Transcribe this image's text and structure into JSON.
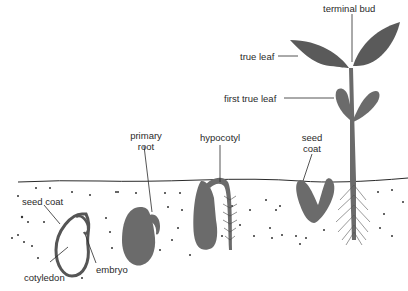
{
  "diagram": {
    "type": "seed germination stages (dicot bean)",
    "colors": {
      "background": "#ffffff",
      "ink": "#2a2a2a",
      "seed_fill": "#6b6b6b",
      "leaf_fill": "#5a5a5a",
      "stem_fill": "#707070",
      "soil_dot": "#333333"
    },
    "stages": [
      {
        "id": "stage-1-seed",
        "labels": [
          "seed coat",
          "cotyledon",
          "embryo"
        ]
      },
      {
        "id": "stage-2-primary-root",
        "labels": [
          "primary root"
        ]
      },
      {
        "id": "stage-3-hypocotyl",
        "labels": [
          "hypocotyl"
        ]
      },
      {
        "id": "stage-4-seed-coat",
        "labels": [
          "seed coat"
        ]
      },
      {
        "id": "stage-5-seedling",
        "labels": [
          "terminal bud",
          "true leaf",
          "first true leaf"
        ]
      }
    ],
    "labels": {
      "seed_coat_1": "seed coat",
      "cotyledon": "cotyledon",
      "embryo": "embryo",
      "primary_root_line1": "primary",
      "primary_root_line2": "root",
      "hypocotyl": "hypocotyl",
      "seed_coat_2_line1": "seed",
      "seed_coat_2_line2": "coat",
      "terminal_bud": "terminal bud",
      "true_leaf": "true leaf",
      "first_true_leaf": "first true leaf"
    }
  }
}
